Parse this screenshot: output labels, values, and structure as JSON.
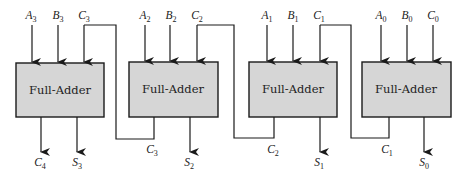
{
  "diagram": {
    "block_label": "Full-Adder",
    "colors": {
      "block_fill": "#d6d6d6",
      "line": "#1a1a1a",
      "background": "#ffffff"
    },
    "blocks": [
      {
        "id": "fa3",
        "label": "Full-Adder",
        "inputs": [
          {
            "base": "A",
            "sub": "3"
          },
          {
            "base": "B",
            "sub": "3"
          },
          {
            "base": "C",
            "sub": "3"
          }
        ],
        "outputs": [
          {
            "base": "C",
            "sub": "4"
          },
          {
            "base": "S",
            "sub": "3"
          }
        ]
      },
      {
        "id": "fa2",
        "label": "Full-Adder",
        "inputs": [
          {
            "base": "A",
            "sub": "2"
          },
          {
            "base": "B",
            "sub": "2"
          },
          {
            "base": "C",
            "sub": "2"
          }
        ],
        "outputs": [
          {
            "base": "C",
            "sub": "3"
          },
          {
            "base": "S",
            "sub": "2"
          }
        ]
      },
      {
        "id": "fa1",
        "label": "Full-Adder",
        "inputs": [
          {
            "base": "A",
            "sub": "1"
          },
          {
            "base": "B",
            "sub": "1"
          },
          {
            "base": "C",
            "sub": "1"
          }
        ],
        "outputs": [
          {
            "base": "C",
            "sub": "2"
          },
          {
            "base": "S",
            "sub": "1"
          }
        ]
      },
      {
        "id": "fa0",
        "label": "Full-Adder",
        "inputs": [
          {
            "base": "A",
            "sub": "0"
          },
          {
            "base": "B",
            "sub": "0"
          },
          {
            "base": "C",
            "sub": "0"
          }
        ],
        "outputs": [
          {
            "base": "C",
            "sub": "1"
          },
          {
            "base": "S",
            "sub": "0"
          }
        ]
      }
    ]
  }
}
